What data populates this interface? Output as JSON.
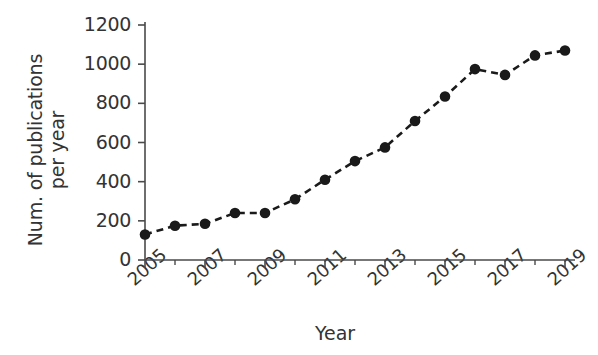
{
  "chart_data": {
    "type": "line",
    "title": "",
    "xlabel": "Year",
    "ylabel": "Num. of publications\nper year",
    "x": [
      2005,
      2006,
      2007,
      2008,
      2009,
      2010,
      2011,
      2012,
      2013,
      2014,
      2015,
      2016,
      2017,
      2018,
      2019
    ],
    "values": [
      130,
      175,
      185,
      240,
      240,
      310,
      410,
      505,
      575,
      710,
      835,
      975,
      945,
      1045,
      1070
    ],
    "series": [
      {
        "name": "Num. of publications per year",
        "values": [
          130,
          175,
          185,
          240,
          240,
          310,
          410,
          505,
          575,
          710,
          835,
          975,
          945,
          1045,
          1070
        ]
      }
    ],
    "xlim": [
      2005,
      2019
    ],
    "ylim": [
      0,
      1200
    ],
    "ytick_labels": [
      "0",
      "200",
      "400",
      "600",
      "800",
      "1000",
      "1200"
    ],
    "ytick_values": [
      0,
      200,
      400,
      600,
      800,
      1000,
      1200
    ],
    "xtick_labels": [
      "2005",
      "2007",
      "2009",
      "2011",
      "2013",
      "2015",
      "2017",
      "2019"
    ],
    "xtick_values": [
      2005,
      2007,
      2009,
      2011,
      2013,
      2015,
      2017,
      2019
    ],
    "xtick_minor_values": [
      2006,
      2008,
      2010,
      2012,
      2014,
      2016,
      2018
    ],
    "grid": false,
    "legend": "none",
    "line_style": "dashed",
    "marker": "circle-filled",
    "line_color": "#1a1a1a",
    "marker_color": "#1a1a1a",
    "axis_color": "#4a4a4a",
    "background_color": "#ffffff",
    "xtick_label_rotation": -42
  }
}
